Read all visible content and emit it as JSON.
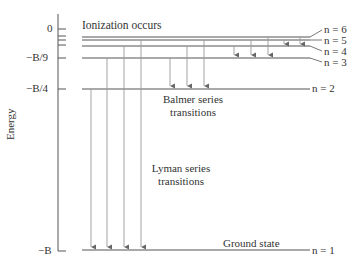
{
  "axis": {
    "label": "Energy",
    "ticks": [
      "0",
      "−B/9",
      "−B/4",
      "−B"
    ]
  },
  "annotations": {
    "ionization": "Ionization occurs",
    "balmer_line1": "Balmer series",
    "balmer_line2": "transitions",
    "lyman_line1": "Lyman series",
    "lyman_line2": "transitions",
    "ground": "Ground state"
  },
  "levels": [
    {
      "label": "n = 6",
      "energy": "-B/36"
    },
    {
      "label": "n = 5",
      "energy": "-B/25"
    },
    {
      "label": "n = 4",
      "energy": "-B/16"
    },
    {
      "label": "n = 3",
      "energy": "-B/9"
    },
    {
      "label": "n = 2",
      "energy": "-B/4"
    },
    {
      "label": "n = 1",
      "energy": "-B"
    }
  ],
  "transitions": {
    "lyman": [
      "3→1",
      "4→1",
      "5→1",
      "6→1"
    ],
    "balmer": [
      "3→2",
      "4→2",
      "5→2"
    ],
    "paschen": [
      "4→3",
      "5→3",
      "6→3"
    ],
    "brackett": [
      "5→4",
      "6→4"
    ]
  },
  "colors": {
    "line": "#555555",
    "arrow": "#888888",
    "text": "#333333"
  }
}
